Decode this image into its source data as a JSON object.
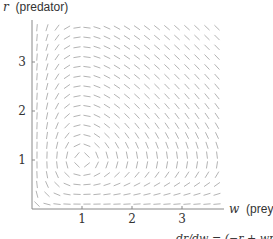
{
  "figure": {
    "y_axis_label_var": "r",
    "y_axis_label_text": "(predator)",
    "x_axis_label_var": "w",
    "x_axis_label_text": "(prey)",
    "x_ticks": [
      "1",
      "2",
      "3"
    ],
    "y_ticks": [
      "1",
      "2",
      "3"
    ],
    "bottom_caption_partial": "dr/dw = (−r + wr)/(w − wr)"
  },
  "slope_field": {
    "system": "Lotka-Volterra predator-prey",
    "dw_dt": "w - w*r",
    "dr_dt": "-r + w*r",
    "equilibrium": [
      1,
      1
    ],
    "w_range": [
      0.1,
      3.7
    ],
    "r_range": [
      0.1,
      3.7
    ],
    "grid_step": 0.2,
    "segment_color": "#aaaaaa",
    "axis_color": "#888888"
  }
}
